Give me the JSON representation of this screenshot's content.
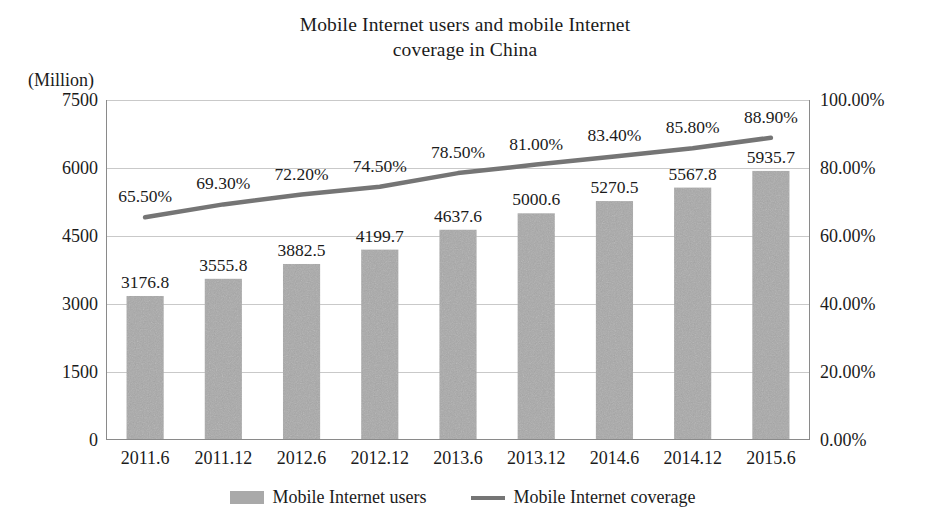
{
  "chart_data": {
    "type": "bar",
    "title": "Mobile Internet users and mobile Internet coverage in China",
    "title_line1": "Mobile Internet users and mobile Internet",
    "title_line2": "coverage in China",
    "xlabel": "",
    "ylabel": "(Million)",
    "y2label": "",
    "grid": true,
    "legend_position": "bottom",
    "categories": [
      "2011.6",
      "2011.12",
      "2012.6",
      "2012.12",
      "2013.6",
      "2013.12",
      "2014.6",
      "2014.12",
      "2015.6"
    ],
    "ylim": [
      0,
      7500
    ],
    "yticks": [
      "0",
      "1500",
      "3000",
      "4500",
      "6000",
      "7500"
    ],
    "ytick_values": [
      0,
      1500,
      3000,
      4500,
      6000,
      7500
    ],
    "y2lim": [
      0,
      100
    ],
    "y2ticks": [
      "0.00%",
      "20.00%",
      "40.00%",
      "60.00%",
      "80.00%",
      "100.00%"
    ],
    "y2tick_values": [
      0,
      20,
      40,
      60,
      80,
      100
    ],
    "series": [
      {
        "name": "Mobile Internet users",
        "type": "bar",
        "axis": "left",
        "unit": "Million",
        "color": "#a9a9a9",
        "values": [
          3176.8,
          3555.8,
          3882.5,
          4199.7,
          4637.6,
          5000.6,
          5270.5,
          5567.8,
          5935.7
        ],
        "labels": [
          "3176.8",
          "3555.8",
          "3882.5",
          "4199.7",
          "4637.6",
          "5000.6",
          "5270.5",
          "5567.8",
          "5935.7"
        ]
      },
      {
        "name": "Mobile Internet coverage",
        "type": "line",
        "axis": "right",
        "unit": "%",
        "color": "#757575",
        "values": [
          65.5,
          69.3,
          72.2,
          74.5,
          78.5,
          81.0,
          83.4,
          85.8,
          88.9
        ],
        "labels": [
          "65.50%",
          "69.30%",
          "72.20%",
          "74.50%",
          "78.50%",
          "81.00%",
          "83.40%",
          "85.80%",
          "88.90%"
        ]
      }
    ]
  },
  "legend": [
    {
      "label": "Mobile Internet users",
      "marker": "bar-swatch-icon",
      "color": "#a9a9a9"
    },
    {
      "label": "Mobile Internet coverage",
      "marker": "line-swatch-icon",
      "color": "#757575"
    }
  ],
  "colors": {
    "background": "#ffffff",
    "bar": "#a9a9a9",
    "line": "#757575",
    "grid": "#c9c9c9",
    "axis": "#8a8a8a",
    "text": "#1b1b1b"
  }
}
